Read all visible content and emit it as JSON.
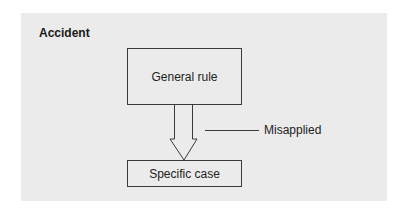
{
  "diagram": {
    "title": "Accident",
    "nodes": [
      {
        "id": "general",
        "label": "General rule"
      },
      {
        "id": "specific",
        "label": "Specific case"
      }
    ],
    "edge": {
      "from": "general",
      "to": "specific",
      "style": "hollow-arrow"
    },
    "annotation": {
      "label": "Misapplied",
      "points_to": "edge"
    },
    "colors": {
      "panel": "#ebebeb",
      "stroke": "#3a3a3a",
      "text": "#222222"
    }
  }
}
